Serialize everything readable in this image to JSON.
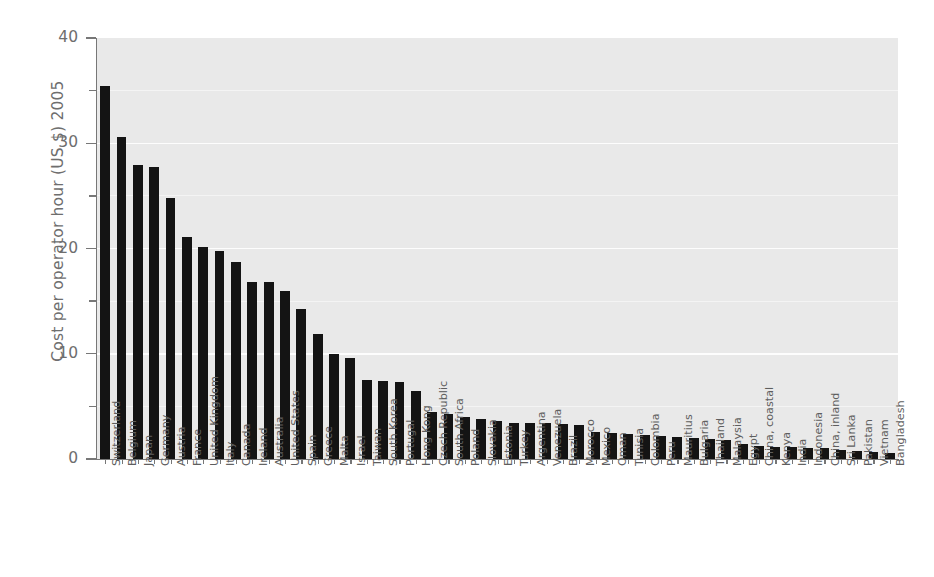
{
  "chart_data": {
    "type": "bar",
    "title": "",
    "xlabel": "",
    "ylabel": "Cost per operator hour (US $) 2005",
    "ylim": [
      0,
      40
    ],
    "yticks": [
      0,
      10,
      20,
      30,
      40
    ],
    "ytick_labels": [
      "0",
      "10",
      "20",
      "30",
      "40"
    ],
    "yminor_ticks": [
      5,
      15,
      25,
      35
    ],
    "grid": true,
    "grid_axis": "y",
    "legend": false,
    "bar_color": "#141414",
    "plot_background": "#e9e9e9",
    "categories": [
      "Switzerland",
      "Belgium",
      "Japan",
      "Germany",
      "Austria",
      "France",
      "United Kingdom",
      "Italy",
      "Canada",
      "Ireland",
      "Australia",
      "United States",
      "Spain",
      "Greece",
      "Malta",
      "Israel",
      "Taiwan",
      "South Korea",
      "Portugal",
      "Hong Kong",
      "Czech Republic",
      "South Africa",
      "Poland",
      "Slovakia",
      "Estonia",
      "Turkey",
      "Argentina",
      "Venezuela",
      "Brazil",
      "Morocco",
      "Mexico",
      "Oman",
      "Tunisia",
      "Colombia",
      "Peru",
      "Mauritius",
      "Bulgaria",
      "Thailand",
      "Malaysia",
      "Egypt",
      "China, coastal",
      "Kenya",
      "India",
      "Indonesia",
      "China, inland",
      "Sri Lanka",
      "Pakistan",
      "Vietnam",
      "Bangladesh"
    ],
    "values": [
      35.4,
      30.6,
      27.9,
      27.7,
      24.8,
      21.1,
      20.1,
      19.8,
      18.7,
      16.8,
      16.8,
      16.0,
      14.3,
      11.9,
      10.0,
      9.6,
      7.5,
      7.4,
      7.3,
      6.5,
      4.5,
      4.3,
      4.0,
      3.8,
      3.6,
      3.4,
      3.4,
      3.4,
      3.3,
      3.2,
      2.6,
      2.5,
      2.4,
      2.3,
      2.2,
      2.1,
      2.0,
      1.9,
      1.8,
      1.4,
      1.2,
      1.1,
      1.1,
      1.0,
      1.0,
      0.9,
      0.8,
      0.7,
      0.6
    ]
  }
}
